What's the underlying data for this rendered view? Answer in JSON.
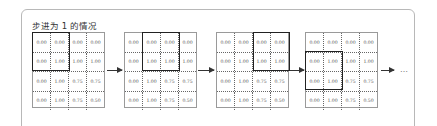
{
  "title": "步进为 1 的情况",
  "grid_values": [
    [
      "0.00",
      "0.00",
      "0.00",
      "0.00"
    ],
    [
      "0.00",
      "1.00",
      "1.00",
      "1.00"
    ],
    [
      "0.00",
      "1.00",
      "0.75",
      "0.75"
    ],
    [
      "0.00",
      "1.00",
      "0.75",
      "0.50"
    ]
  ],
  "steps": [
    {
      "label": "step-1",
      "window_row": 0,
      "window_col": 0
    },
    {
      "label": "step-2",
      "window_row": 0,
      "window_col": 1
    },
    {
      "label": "step-3",
      "window_row": 0,
      "window_col": 2
    },
    {
      "label": "step-4",
      "window_row": 1,
      "window_col": 0
    }
  ],
  "window_size": 2,
  "ellipsis": "…",
  "colors": {
    "border": "#9a9a9a",
    "window": "#222222",
    "frame": "#b8b8b8"
  }
}
